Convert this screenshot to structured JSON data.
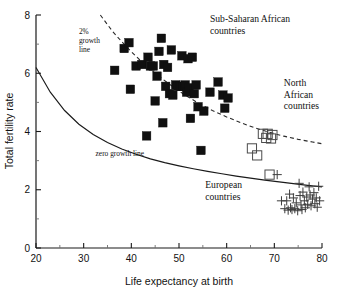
{
  "chart_data": {
    "type": "scatter",
    "title": "",
    "xlabel": "Life expectancy at birth",
    "ylabel": "Total fertility rate",
    "xlim": [
      20,
      80
    ],
    "ylim": [
      0,
      8
    ],
    "grid": false,
    "legend_position": "in-plot annotations",
    "x_ticks_major": [
      20,
      30,
      40,
      50,
      60,
      70,
      80
    ],
    "x_ticks_minor": [
      25,
      35,
      45,
      55,
      65,
      75
    ],
    "y_ticks_major": [
      0,
      2,
      4,
      6,
      8
    ],
    "y_ticks_minor": [
      1,
      3,
      5,
      7
    ],
    "annotations": [
      {
        "name": "sub-saharan-label",
        "text_lines": [
          "Sub-Saharan African",
          "countries"
        ],
        "x": 56.5,
        "y": 7.75
      },
      {
        "name": "north-african-label",
        "text_lines": [
          "North",
          "African",
          "countries"
        ],
        "x": 72.0,
        "y": 5.55
      },
      {
        "name": "european-label",
        "text_lines": [
          "European",
          "countries"
        ],
        "x": 55.5,
        "y": 2.05
      },
      {
        "name": "two-percent-growth-label",
        "text_lines": [
          "2%",
          "growth",
          "line"
        ],
        "x": 29.0,
        "y": 7.35
      },
      {
        "name": "zero-growth-label",
        "text_lines": [
          "zero growth line"
        ],
        "x": 32.5,
        "y": 3.15
      }
    ],
    "curves": [
      {
        "name": "zero-growth-line",
        "style": "solid",
        "points": [
          [
            20,
            6.2
          ],
          [
            23,
            5.35
          ],
          [
            26,
            4.72
          ],
          [
            29,
            4.25
          ],
          [
            32,
            3.9
          ],
          [
            35,
            3.62
          ],
          [
            38,
            3.4
          ],
          [
            41,
            3.22
          ],
          [
            44,
            3.06
          ],
          [
            47,
            2.93
          ],
          [
            50,
            2.82
          ],
          [
            53,
            2.72
          ],
          [
            56,
            2.63
          ],
          [
            59,
            2.55
          ],
          [
            62,
            2.47
          ],
          [
            65,
            2.4
          ],
          [
            68,
            2.33
          ],
          [
            71,
            2.27
          ],
          [
            74,
            2.21
          ],
          [
            77,
            2.15
          ],
          [
            80,
            2.1
          ]
        ]
      },
      {
        "name": "two-percent-growth-line",
        "style": "dashed",
        "points": [
          [
            33.5,
            8.0
          ],
          [
            36,
            7.45
          ],
          [
            39,
            6.9
          ],
          [
            42,
            6.42
          ],
          [
            45,
            6.0
          ],
          [
            48,
            5.62
          ],
          [
            51,
            5.28
          ],
          [
            54,
            4.98
          ],
          [
            57,
            4.72
          ],
          [
            60,
            4.5
          ],
          [
            63,
            4.3
          ],
          [
            66,
            4.12
          ],
          [
            69,
            3.97
          ],
          [
            72,
            3.84
          ],
          [
            75,
            3.73
          ],
          [
            78,
            3.64
          ],
          [
            80,
            3.58
          ]
        ]
      }
    ],
    "series": [
      {
        "name": "Sub-Saharan African countries",
        "marker": "filled-square",
        "color": "#101010",
        "points": [
          [
            36.5,
            6.1
          ],
          [
            38.5,
            6.85
          ],
          [
            39.5,
            7.05
          ],
          [
            39.8,
            5.45
          ],
          [
            41.0,
            6.25
          ],
          [
            42.2,
            6.3
          ],
          [
            43.2,
            3.85
          ],
          [
            43.5,
            6.55
          ],
          [
            44.0,
            6.25
          ],
          [
            44.6,
            6.25
          ],
          [
            45.0,
            5.05
          ],
          [
            45.4,
            5.9
          ],
          [
            45.8,
            6.75
          ],
          [
            46.3,
            7.2
          ],
          [
            46.6,
            4.3
          ],
          [
            46.8,
            6.3
          ],
          [
            47.2,
            5.55
          ],
          [
            47.6,
            6.2
          ],
          [
            48.0,
            5.3
          ],
          [
            48.4,
            6.8
          ],
          [
            48.7,
            5.25
          ],
          [
            49.3,
            5.6
          ],
          [
            49.8,
            5.55
          ],
          [
            50.3,
            5.55
          ],
          [
            50.6,
            6.6
          ],
          [
            50.9,
            5.55
          ],
          [
            51.3,
            5.6
          ],
          [
            51.6,
            5.35
          ],
          [
            51.9,
            6.5
          ],
          [
            52.1,
            5.5
          ],
          [
            52.4,
            4.45
          ],
          [
            52.8,
            6.55
          ],
          [
            53.2,
            5.3
          ],
          [
            53.6,
            5.6
          ],
          [
            54.0,
            4.85
          ],
          [
            54.6,
            3.35
          ],
          [
            55.2,
            4.7
          ],
          [
            56.5,
            5.35
          ],
          [
            58.2,
            5.7
          ],
          [
            59.2,
            5.25
          ],
          [
            59.6,
            4.8
          ],
          [
            60.3,
            5.15
          ]
        ]
      },
      {
        "name": "North African countries",
        "marker": "open-square",
        "color": "#4a4a4a",
        "points": [
          [
            67.6,
            3.92
          ],
          [
            68.6,
            3.92
          ],
          [
            69.6,
            3.88
          ],
          [
            68.3,
            3.78
          ],
          [
            69.3,
            3.76
          ],
          [
            65.3,
            3.42
          ],
          [
            66.4,
            3.18
          ],
          [
            69.0,
            2.52
          ]
        ]
      },
      {
        "name": "European countries",
        "marker": "plus",
        "color": "#3d3d3d",
        "points": [
          [
            70.6,
            2.52
          ],
          [
            71.5,
            1.62
          ],
          [
            72.2,
            1.35
          ],
          [
            72.6,
            1.62
          ],
          [
            72.9,
            1.3
          ],
          [
            73.2,
            1.85
          ],
          [
            73.4,
            1.38
          ],
          [
            73.7,
            1.32
          ],
          [
            74.0,
            1.72
          ],
          [
            74.3,
            1.35
          ],
          [
            74.6,
            1.55
          ],
          [
            74.9,
            1.28
          ],
          [
            75.2,
            2.22
          ],
          [
            75.4,
            1.8
          ],
          [
            75.6,
            1.48
          ],
          [
            75.8,
            1.32
          ],
          [
            76.0,
            1.92
          ],
          [
            76.3,
            1.62
          ],
          [
            76.5,
            1.38
          ],
          [
            76.8,
            1.75
          ],
          [
            77.0,
            1.5
          ],
          [
            77.3,
            2.1
          ],
          [
            77.5,
            1.82
          ],
          [
            77.7,
            1.45
          ],
          [
            78.0,
            1.68
          ],
          [
            78.3,
            1.9
          ],
          [
            78.5,
            1.52
          ],
          [
            78.8,
            1.72
          ],
          [
            79.0,
            1.4
          ],
          [
            79.3,
            2.12
          ],
          [
            79.5,
            1.62
          ]
        ]
      }
    ]
  }
}
